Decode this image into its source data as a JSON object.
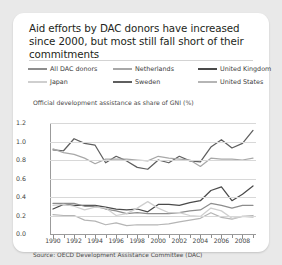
{
  "card": {
    "title": "Aid efforts by DAC donors have increased since 2000, but most still fall short of their commitments",
    "subtitle": "Official development assistance as share of GNI (%)",
    "source": "Source: OECD Development Assistance Committee (DAC)"
  },
  "legend": {
    "items": [
      {
        "label": "All DAC donors",
        "color": "#8d8d8d",
        "row": 0,
        "col": 0
      },
      {
        "label": "Netherlands",
        "color": "#a8a8a8",
        "row": 0,
        "col": 1
      },
      {
        "label": "United Kingdom",
        "color": "#4a4a4a",
        "row": 0,
        "col": 2
      },
      {
        "label": "Japan",
        "color": "#cfcfcf",
        "row": 1,
        "col": 0
      },
      {
        "label": "Sweden",
        "color": "#5f5f5f",
        "row": 1,
        "col": 1
      },
      {
        "label": "United States",
        "color": "#b5b5b5",
        "row": 1,
        "col": 2
      }
    ]
  },
  "chart_data": {
    "type": "line",
    "title": "Aid efforts by DAC donors have increased since 2000, but most still fall short of their commitments",
    "subtitle": "Official development assistance as share of GNI (%)",
    "xlabel": "",
    "ylabel": "Official development assistance as share of GNI (%)",
    "ylim": [
      0.0,
      1.2
    ],
    "yticks": [
      0.0,
      0.2,
      0.4,
      0.6,
      0.8,
      1.0,
      1.2
    ],
    "ytick_labels": [
      "0.0",
      "0.2",
      "0.4",
      "0.6",
      "0.8",
      "1.0",
      "1.2"
    ],
    "xlim": [
      1990,
      2009
    ],
    "x": [
      1990,
      1991,
      1992,
      1993,
      1994,
      1995,
      1996,
      1997,
      1998,
      1999,
      2000,
      2001,
      2002,
      2003,
      2004,
      2005,
      2006,
      2007,
      2008,
      2009
    ],
    "xticks": [
      1990,
      1991,
      1992,
      1993,
      1994,
      1995,
      1996,
      1997,
      1998,
      1999,
      2000,
      2001,
      2002,
      2003,
      2004,
      2005,
      2006,
      2007,
      2008,
      2009
    ],
    "xtick_labels_shown": [
      "1990",
      "1992",
      "1994",
      "1996",
      "1998",
      "2000",
      "2002",
      "2004",
      "2006",
      "2008"
    ],
    "grid": true,
    "legend_position": "above-plot",
    "series": [
      {
        "name": "Sweden",
        "color": "#5f5f5f",
        "values": [
          0.91,
          0.9,
          1.03,
          0.98,
          0.96,
          0.77,
          0.84,
          0.79,
          0.72,
          0.7,
          0.8,
          0.77,
          0.84,
          0.79,
          0.78,
          0.94,
          1.02,
          0.93,
          0.98,
          1.12
        ]
      },
      {
        "name": "Netherlands",
        "color": "#a8a8a8",
        "values": [
          0.92,
          0.88,
          0.86,
          0.82,
          0.76,
          0.81,
          0.81,
          0.81,
          0.8,
          0.79,
          0.84,
          0.82,
          0.81,
          0.8,
          0.73,
          0.82,
          0.81,
          0.81,
          0.8,
          0.82
        ]
      },
      {
        "name": "United Kingdom",
        "color": "#4a4a4a",
        "values": [
          0.27,
          0.32,
          0.31,
          0.31,
          0.31,
          0.29,
          0.27,
          0.26,
          0.27,
          0.24,
          0.32,
          0.32,
          0.31,
          0.34,
          0.36,
          0.47,
          0.51,
          0.36,
          0.43,
          0.52
        ]
      },
      {
        "name": "All DAC donors",
        "color": "#8d8d8d",
        "values": [
          0.33,
          0.33,
          0.33,
          0.3,
          0.3,
          0.27,
          0.25,
          0.22,
          0.23,
          0.22,
          0.22,
          0.22,
          0.23,
          0.25,
          0.26,
          0.33,
          0.31,
          0.28,
          0.31,
          0.31
        ]
      },
      {
        "name": "United States",
        "color": "#b5b5b5",
        "values": [
          0.21,
          0.2,
          0.2,
          0.15,
          0.14,
          0.1,
          0.12,
          0.09,
          0.1,
          0.1,
          0.1,
          0.11,
          0.13,
          0.15,
          0.17,
          0.23,
          0.18,
          0.16,
          0.19,
          0.2
        ]
      },
      {
        "name": "Japan",
        "color": "#cfcfcf",
        "values": [
          0.31,
          0.32,
          0.3,
          0.26,
          0.29,
          0.28,
          0.2,
          0.22,
          0.28,
          0.35,
          0.28,
          0.23,
          0.23,
          0.2,
          0.19,
          0.28,
          0.25,
          0.17,
          0.19,
          0.18
        ]
      }
    ]
  }
}
